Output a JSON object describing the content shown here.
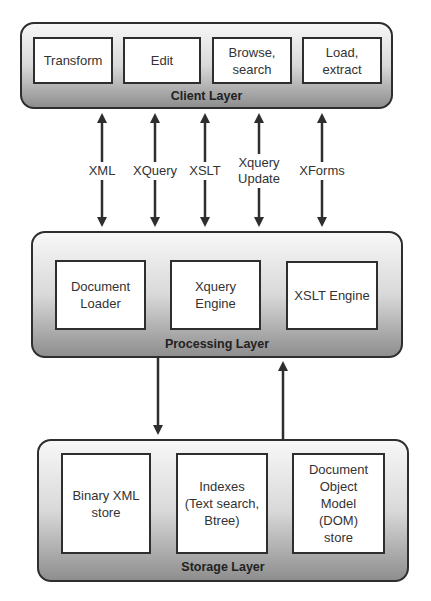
{
  "client_layer": {
    "title": "Client Layer",
    "components": [
      {
        "label": "Transform"
      },
      {
        "label": "Edit"
      },
      {
        "label": "Browse,\nsearch"
      },
      {
        "label": "Load,\nextract"
      }
    ]
  },
  "interfaces": [
    {
      "label": "XML"
    },
    {
      "label": "XQuery"
    },
    {
      "label": "XSLT"
    },
    {
      "label": "Xquery\nUpdate"
    },
    {
      "label": "XForms"
    }
  ],
  "processing_layer": {
    "title": "Processing Layer",
    "components": [
      {
        "label": "Document\nLoader"
      },
      {
        "label": "Xquery\nEngine"
      },
      {
        "label": "XSLT Engine"
      }
    ]
  },
  "storage_layer": {
    "title": "Storage Layer",
    "components": [
      {
        "label": "Binary XML\nstore"
      },
      {
        "label": "Indexes\n(Text search,\nBtree)"
      },
      {
        "label": "Document\nObject\nModel\n(DOM)\nstore"
      }
    ]
  },
  "colors": {
    "stroke": "#2e2e2e",
    "box_fill": "#ffffff",
    "layer_gradient_top": "#f7f7f7",
    "layer_gradient_bottom": "#8e8e8e"
  }
}
